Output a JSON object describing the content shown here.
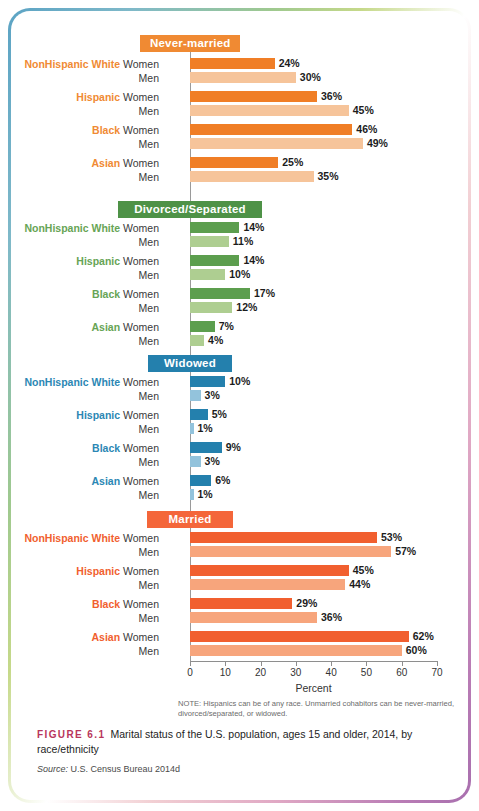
{
  "figure": {
    "number": "FIGURE 6.1",
    "caption": "Marital status of the U.S. population, ages 15 and older, 2014, by race/ethnicity",
    "source_label": "Source:",
    "source_text": " U.S. Census Bureau 2014d",
    "note": "NOTE: Hispanics can be of any race. Unmarried cohabitors can be never-married, divorced/separated, or widowed."
  },
  "chart_data": {
    "type": "bar",
    "title": "Marital status of the U.S. population, ages 15 and older, 2014, by race/ethnicity",
    "xlabel": "Percent",
    "ylabel": "",
    "xlim": [
      0,
      70
    ],
    "xticks": [
      0,
      10,
      20,
      30,
      40,
      50,
      60,
      70
    ],
    "grid": false,
    "legend": "none",
    "orientation": "horizontal",
    "categories": [
      "NonHispanic White",
      "Hispanic",
      "Black",
      "Asian"
    ],
    "series_names": [
      "Women",
      "Men"
    ],
    "panels": [
      {
        "name": "Never-married",
        "color_dark": "#F07E26",
        "color_light": "#F6C49A",
        "label_color": "#F08A33",
        "header_bg": "#F08A33",
        "rows": [
          {
            "category": "NonHispanic White",
            "women": 24,
            "men": 30,
            "women_label": "24%",
            "men_label": "30%"
          },
          {
            "category": "Hispanic",
            "women": 36,
            "men": 45,
            "women_label": "36%",
            "men_label": "45%"
          },
          {
            "category": "Black",
            "women": 46,
            "men": 49,
            "women_label": "46%",
            "men_label": "49%"
          },
          {
            "category": "Asian",
            "women": 25,
            "men": 35,
            "women_label": "25%",
            "men_label": "35%"
          }
        ]
      },
      {
        "name": "Divorced/Separated",
        "color_dark": "#5C9E4E",
        "color_light": "#AECE91",
        "label_color": "#67A455",
        "header_bg": "#4E9247",
        "rows": [
          {
            "category": "NonHispanic White",
            "women": 14,
            "men": 11,
            "women_label": "14%",
            "men_label": "11%"
          },
          {
            "category": "Hispanic",
            "women": 14,
            "men": 10,
            "women_label": "14%",
            "men_label": "10%"
          },
          {
            "category": "Black",
            "women": 17,
            "men": 12,
            "women_label": "17%",
            "men_label": "12%"
          },
          {
            "category": "Asian",
            "women": 7,
            "men": 4,
            "women_label": "7%",
            "men_label": "4%"
          }
        ]
      },
      {
        "name": "Widowed",
        "color_dark": "#2480AD",
        "color_light": "#93C3DC",
        "label_color": "#2B87B4",
        "header_bg": "#2480AD",
        "rows": [
          {
            "category": "NonHispanic White",
            "women": 10,
            "men": 3,
            "women_label": "10%",
            "men_label": "3%"
          },
          {
            "category": "Hispanic",
            "women": 5,
            "men": 1,
            "women_label": "5%",
            "men_label": "1%"
          },
          {
            "category": "Black",
            "women": 9,
            "men": 3,
            "women_label": "9%",
            "men_label": "3%"
          },
          {
            "category": "Asian",
            "women": 6,
            "men": 1,
            "women_label": "6%",
            "men_label": "1%"
          }
        ]
      },
      {
        "name": "Married",
        "color_dark": "#F15F2F",
        "color_light": "#F7A57C",
        "label_color": "#F15F2F",
        "header_bg": "#F4663A",
        "rows": [
          {
            "category": "NonHispanic White",
            "women": 53,
            "men": 57,
            "women_label": "53%",
            "men_label": "57%"
          },
          {
            "category": "Hispanic",
            "women": 45,
            "men": 44,
            "women_label": "45%",
            "men_label": "44%"
          },
          {
            "category": "Black",
            "women": 29,
            "men": 36,
            "women_label": "29%",
            "men_label": "36%"
          },
          {
            "category": "Asian",
            "women": 62,
            "men": 60,
            "women_label": "62%",
            "men_label": "60%"
          }
        ]
      }
    ]
  }
}
